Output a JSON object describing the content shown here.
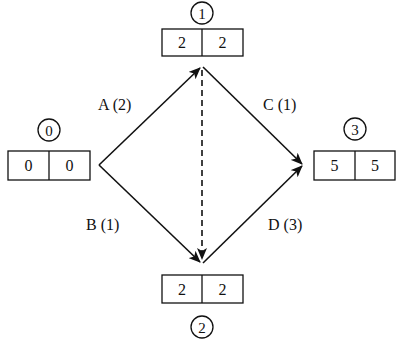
{
  "diagram": {
    "type": "activity-on-arrow network",
    "nodes": [
      {
        "id": "0",
        "label": "0",
        "early": "0",
        "late": "0"
      },
      {
        "id": "1",
        "label": "1",
        "early": "2",
        "late": "2"
      },
      {
        "id": "2",
        "label": "2",
        "early": "2",
        "late": "2"
      },
      {
        "id": "3",
        "label": "3",
        "early": "5",
        "late": "5"
      }
    ],
    "edges": [
      {
        "from": "0",
        "to": "1",
        "label": "A (2)",
        "style": "solid"
      },
      {
        "from": "0",
        "to": "2",
        "label": "B (1)",
        "style": "solid"
      },
      {
        "from": "1",
        "to": "3",
        "label": "C (1)",
        "style": "solid"
      },
      {
        "from": "2",
        "to": "3",
        "label": "D (3)",
        "style": "solid"
      },
      {
        "from": "1",
        "to": "2",
        "label": "",
        "style": "dashed"
      }
    ]
  }
}
